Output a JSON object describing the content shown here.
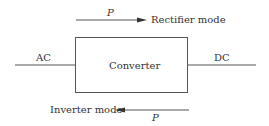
{
  "diagram": {
    "block": {
      "label": "Converter"
    },
    "left_port": {
      "label": "AC"
    },
    "right_port": {
      "label": "DC"
    },
    "top_flow": {
      "power_label": "P",
      "mode_label": "Rectifier mode",
      "direction": "right"
    },
    "bottom_flow": {
      "power_label": "P",
      "mode_label": "Inverter mode",
      "direction": "left"
    }
  },
  "colors": {
    "stroke": "#555555",
    "text": "#333333"
  }
}
